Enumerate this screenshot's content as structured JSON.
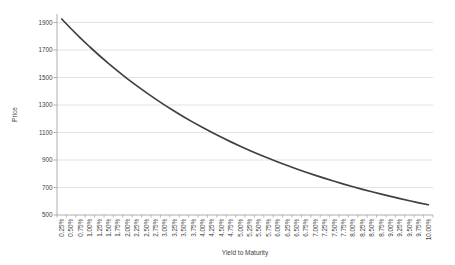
{
  "chart_data": {
    "type": "line",
    "title": "",
    "xlabel": "Yield to Maturity",
    "ylabel": "Price",
    "categories": [
      "0.25%",
      "0.50%",
      "0.75%",
      "1.00%",
      "1.25%",
      "1.50%",
      "1.75%",
      "2.00%",
      "2.25%",
      "2.50%",
      "2.75%",
      "3.00%",
      "3.25%",
      "3.50%",
      "3.75%",
      "4.00%",
      "4.25%",
      "4.50%",
      "4.75%",
      "5.00%",
      "5.25%",
      "5.50%",
      "5.75%",
      "6.00%",
      "6.25%",
      "6.50%",
      "6.75%",
      "7.00%",
      "7.25%",
      "7.50%",
      "7.75%",
      "8.00%",
      "8.25%",
      "8.50%",
      "8.75%",
      "9.00%",
      "9.25%",
      "9.50%",
      "9.75%",
      "10.00%"
    ],
    "series": [
      {
        "name": "Price",
        "values": [
          1925.5,
          1854.4,
          1786.6,
          1721.8,
          1660.0,
          1600.9,
          1544.5,
          1490.5,
          1439.0,
          1389.7,
          1342.6,
          1297.5,
          1254.4,
          1213.2,
          1173.7,
          1135.9,
          1099.7,
          1065.0,
          1031.8,
          1000.0,
          969.5,
          940.2,
          912.2,
          885.3,
          859.5,
          834.7,
          810.9,
          788.1,
          766.2,
          745.1,
          724.9,
          705.5,
          686.8,
          668.8,
          651.5,
          634.9,
          618.9,
          603.4,
          588.6,
          574.3
        ]
      }
    ],
    "ylim": [
      500,
      1900
    ],
    "yticks": [
      500,
      700,
      900,
      1100,
      1300,
      1500,
      1700,
      1900
    ],
    "grid": "horizontal-only",
    "legend": "none",
    "x_tick_label_rotation_deg": -90,
    "colors": {
      "line": "#404040",
      "gridline": "#dcdcdc",
      "axis": "#a6a6a6",
      "text": "#404040",
      "background": "#ffffff"
    }
  }
}
